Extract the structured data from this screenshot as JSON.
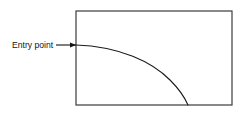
{
  "diagram": {
    "background_color": "#ffffff",
    "line_color": "#3b3b3b",
    "curve_color": "#1a1a1a",
    "text_color": "#141414",
    "annotation": {
      "label": "Entry point",
      "label_x": 12,
      "label_y": 45,
      "leader_start_x": 56,
      "leader_end_x": 76,
      "leader_y": 45,
      "arrowhead": "arrow-right"
    },
    "boundary": {
      "name": "rectangle",
      "x": 76,
      "y": 11,
      "width": 156,
      "height": 94,
      "stroke_width": 1.2
    },
    "trajectory": {
      "name": "entry-curve",
      "start_x": 76,
      "start_y": 45,
      "end_x": 188,
      "end_y": 105,
      "control_x": 160,
      "control_y": 48,
      "stroke_width": 1.1,
      "shape": "concave-down"
    }
  }
}
